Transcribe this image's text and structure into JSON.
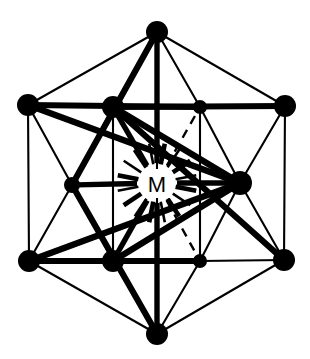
{
  "figure": {
    "kind": "coordination-cluster-diagram",
    "title": "",
    "center_label": "M",
    "background_color": "#ffffff",
    "ink_color": "#000000",
    "width": 310,
    "height": 359
  },
  "chart_data": {
    "type": "diagram",
    "title": "",
    "center": {
      "id": "M",
      "label": "M",
      "x": 157,
      "y": 183
    },
    "outer_vertices": [
      {
        "id": "O1",
        "label": "",
        "x": 157,
        "y": 32,
        "r": 11,
        "position": "top"
      },
      {
        "id": "O2",
        "label": "",
        "x": 28,
        "y": 105,
        "r": 11,
        "position": "upper-left"
      },
      {
        "id": "O3",
        "label": "",
        "x": 285,
        "y": 106,
        "r": 11,
        "position": "upper-right"
      },
      {
        "id": "O4",
        "label": "",
        "x": 29,
        "y": 261,
        "r": 11,
        "position": "lower-left"
      },
      {
        "id": "O5",
        "label": "",
        "x": 284,
        "y": 260,
        "r": 11,
        "position": "lower-right"
      },
      {
        "id": "O6",
        "label": "",
        "x": 157,
        "y": 334,
        "r": 11,
        "position": "bottom"
      }
    ],
    "inner_vertices": [
      {
        "id": "I1",
        "label": "",
        "x": 113,
        "y": 107,
        "r": 11,
        "position": "inner-upper-left"
      },
      {
        "id": "I2",
        "label": "",
        "x": 200,
        "y": 107,
        "r": 7,
        "position": "inner-upper-right"
      },
      {
        "id": "I3",
        "label": "",
        "x": 72,
        "y": 185,
        "r": 8,
        "position": "inner-left"
      },
      {
        "id": "I4",
        "label": "",
        "x": 240,
        "y": 183,
        "r": 12,
        "position": "inner-right"
      },
      {
        "id": "I5",
        "label": "",
        "x": 113,
        "y": 261,
        "r": 11,
        "position": "inner-lower-left"
      },
      {
        "id": "I6",
        "label": "",
        "x": 200,
        "y": 261,
        "r": 7,
        "position": "inner-lower-right"
      }
    ],
    "thin_edges": [
      [
        "O1",
        "O2"
      ],
      [
        "O1",
        "O3"
      ],
      [
        "O2",
        "O4"
      ],
      [
        "O3",
        "O5"
      ],
      [
        "O4",
        "O6"
      ],
      [
        "O5",
        "O6"
      ],
      [
        "O2",
        "I1"
      ],
      [
        "O2",
        "I3"
      ],
      [
        "O4",
        "I3"
      ],
      [
        "O4",
        "I5"
      ],
      [
        "O1",
        "I1"
      ],
      [
        "O1",
        "I2"
      ],
      [
        "O3",
        "I2"
      ],
      [
        "O3",
        "I4"
      ],
      [
        "O5",
        "I4"
      ],
      [
        "O5",
        "I6"
      ],
      [
        "O6",
        "I5"
      ],
      [
        "O6",
        "I6"
      ],
      [
        "I1",
        "I2"
      ],
      [
        "I1",
        "I3"
      ],
      [
        "I3",
        "I5"
      ],
      [
        "I5",
        "I6"
      ],
      [
        "I2",
        "I4"
      ],
      [
        "I4",
        "I6"
      ],
      [
        "I1",
        "I5"
      ],
      [
        "I2",
        "I6"
      ],
      [
        "O1",
        "O6"
      ]
    ],
    "thick_edges": [
      [
        "O2",
        "I4"
      ],
      [
        "O4",
        "I4"
      ],
      [
        "O3",
        "I1"
      ],
      [
        "O5",
        "I1"
      ],
      [
        "O2",
        "I2"
      ],
      [
        "O4",
        "I6"
      ],
      [
        "I1",
        "I4"
      ],
      [
        "I5",
        "I4"
      ],
      [
        "O1",
        "I3"
      ],
      [
        "O6",
        "I3"
      ]
    ],
    "spokes_solid": [
      [
        "M",
        "I1"
      ],
      [
        "M",
        "I4"
      ],
      [
        "M",
        "I5"
      ],
      [
        "M",
        "I3"
      ],
      [
        "M",
        "O1"
      ],
      [
        "M",
        "O6"
      ]
    ],
    "spokes_dashed": [
      [
        "M",
        "I2"
      ],
      [
        "M",
        "I6"
      ]
    ],
    "radial_ticks_count": 16,
    "legend": [],
    "annotations": [
      {
        "text": "M",
        "x": 157,
        "y": 183,
        "role": "metal-center-label"
      }
    ]
  }
}
